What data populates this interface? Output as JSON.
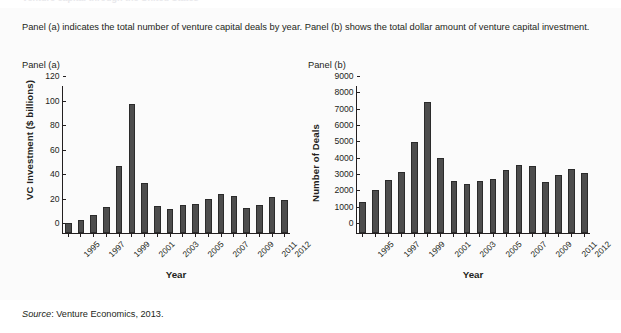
{
  "heading_ghost": "Venture capital through the United States",
  "caption": "Panel (a) indicates the total number of venture capital deals by year. Panel (b) shows the total dollar amount of venture capital investment.",
  "panel_a_label": "Panel (a)",
  "panel_b_label": "Panel (b)",
  "source": {
    "word": "Source",
    "text": ": Venture Economics, 2013."
  },
  "colors": {
    "bar_fill": "#4d4d4d",
    "bar_edge": "#2b2b2b",
    "axis": "#231f20",
    "panel_bg": "#fbfbfb"
  },
  "chart_data": [
    {
      "type": "bar",
      "panel": "Panel (a)",
      "title": "",
      "xlabel": "Year",
      "ylabel": "VC Investment ($ billions)",
      "ylim": [
        0,
        120
      ],
      "yticks": [
        0,
        20,
        40,
        60,
        80,
        100,
        120
      ],
      "grid": false,
      "categories": [
        "1995",
        "1996",
        "1997",
        "1998",
        "1999",
        "2000",
        "2001",
        "2002",
        "2003",
        "2004",
        "2005",
        "2006",
        "2007",
        "2008",
        "2009",
        "2010",
        "2011",
        "2012"
      ],
      "tick_labels": [
        "1995",
        "",
        "1997",
        "",
        "1999",
        "",
        "2001",
        "",
        "2003",
        "",
        "2005",
        "",
        "2007",
        "",
        "2009",
        "",
        "2011",
        "2012"
      ],
      "values": [
        8,
        11,
        15,
        21.5,
        55,
        105,
        41,
        22,
        19.5,
        23,
        24,
        27.5,
        32,
        30.5,
        20.5,
        23,
        29.5,
        27
      ]
    },
    {
      "type": "bar",
      "panel": "Panel (b)",
      "title": "",
      "xlabel": "Year",
      "ylabel": "Number of Deals",
      "ylim": [
        0,
        9000
      ],
      "yticks": [
        0,
        1000,
        2000,
        3000,
        4000,
        5000,
        6000,
        7000,
        8000,
        9000
      ],
      "grid": false,
      "categories": [
        "1995",
        "1996",
        "1997",
        "1998",
        "1999",
        "2000",
        "2001",
        "2002",
        "2003",
        "2004",
        "2005",
        "2006",
        "2007",
        "2008",
        "2009",
        "2010",
        "2011",
        "2012"
      ],
      "tick_labels": [
        "1995",
        "",
        "1997",
        "",
        "1999",
        "",
        "2001",
        "",
        "2003",
        "",
        "2005",
        "",
        "2007",
        "",
        "2009",
        "",
        "2011",
        "2012"
      ],
      "values": [
        1900,
        2630,
        3270,
        3740,
        5580,
        8010,
        4570,
        3200,
        3020,
        3200,
        3290,
        3880,
        4180,
        4130,
        3140,
        3580,
        3930,
        3650
      ]
    }
  ]
}
